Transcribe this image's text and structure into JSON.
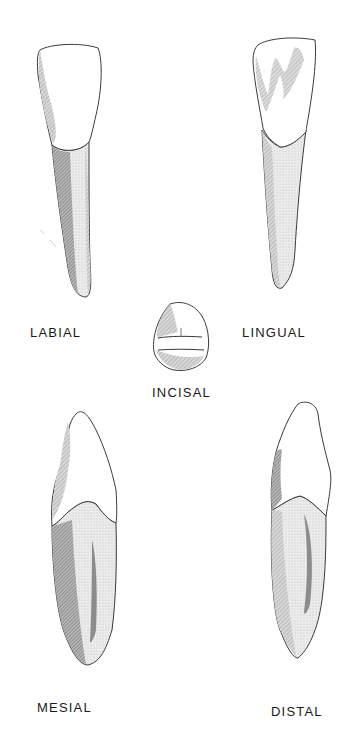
{
  "figure": {
    "views": [
      {
        "id": "labial",
        "label": "LABIAL"
      },
      {
        "id": "lingual",
        "label": "LINGUAL"
      },
      {
        "id": "incisal",
        "label": "INCISAL"
      },
      {
        "id": "mesial",
        "label": "MESIAL"
      },
      {
        "id": "distal",
        "label": "DISTAL"
      }
    ],
    "colors": {
      "background": "#ffffff",
      "outline": "#3a3a3a",
      "shade_dark": "#8c8c8c",
      "shade_mid": "#c4c4c4",
      "shade_light": "#e6e6e6",
      "label": "#1a1a1a"
    }
  }
}
